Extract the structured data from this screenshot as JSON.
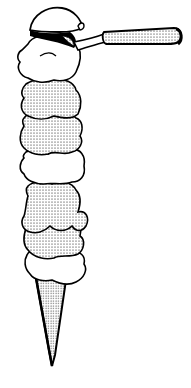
{
  "illustration": {
    "subject": "Tall ice cream cone with stacked scoops and an ice cream scoop",
    "colors": {
      "ink": "#000000",
      "paper": "#ffffff",
      "stipple": "#000000"
    },
    "scoops": [
      {
        "fill": "plain"
      },
      {
        "fill": "stippled"
      },
      {
        "fill": "stippled"
      },
      {
        "fill": "plain"
      },
      {
        "fill": "stippled"
      },
      {
        "fill": "stippled"
      },
      {
        "fill": "plain"
      }
    ],
    "cone": {
      "fill": "stippled"
    },
    "tool": {
      "name": "ice-cream-scoop",
      "handle_fill": "stippled"
    }
  }
}
